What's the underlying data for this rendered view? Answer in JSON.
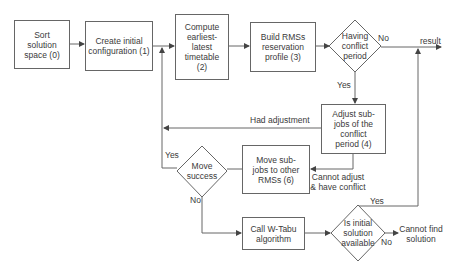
{
  "diagram": {
    "type": "flowchart",
    "colors": {
      "stroke": "#666666",
      "text": "#3a3a3a",
      "background": "#ffffff"
    },
    "nodes": {
      "sort": {
        "label": "Sort solution space (0)"
      },
      "create": {
        "label": "Create initial configuration (1)"
      },
      "compute": {
        "label": "Compute earliest-latest timetable (2)"
      },
      "build": {
        "label": "Build RMSs reservation profile (3)"
      },
      "conflict": {
        "label": "Having conflict period"
      },
      "adjust": {
        "label": "Adjust sub-jobs of the conflict period (4)"
      },
      "move": {
        "label": "Move sub-jobs to other RMSs (6)"
      },
      "move_success": {
        "label": "Move success"
      },
      "wtabu": {
        "label": "Call W-Tabu algorithm"
      },
      "initial_available": {
        "label": "Is initial solution available"
      }
    },
    "edge_labels": {
      "conflict_no": "No",
      "conflict_yes": "Yes",
      "result": "result",
      "had_adjustment": "Had adjustment",
      "cannot_adjust": "Cannot adjust & have conflict",
      "move_yes": "Yes",
      "move_no": "No",
      "initial_yes": "Yes",
      "initial_no": "No",
      "cannot_find": "Cannot find solution"
    }
  }
}
